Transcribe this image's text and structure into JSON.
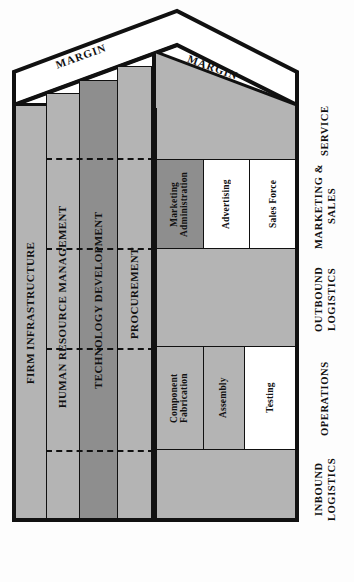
{
  "diagram": {
    "margin_label_left": "MARGIN",
    "margin_label_right": "MARGIN",
    "colors": {
      "support_light": "#b4b4b4",
      "support_dark": "#8e8e8e",
      "primary_gray": "#b4b4b4",
      "primary_dark": "#8e8e8e",
      "primary_white": "#ffffff",
      "stroke": "#111111",
      "background": "#fdfdfd"
    }
  },
  "support_activities": [
    {
      "label": "FIRM INFRASTRUCTURE",
      "shade": "light"
    },
    {
      "label": "HUMAN RESOURCE MANAGEMENT",
      "shade": "light"
    },
    {
      "label": "TECHNOLOGY DEVELOPMENT",
      "shade": "dark"
    },
    {
      "label": "PROCUREMENT",
      "shade": "light"
    }
  ],
  "primary_activities": [
    {
      "label": "SERVICE",
      "boxes": []
    },
    {
      "label": "MARKETING &\nSALES",
      "boxes": [
        {
          "label": "Marketing\nAdministration",
          "shade": "dark"
        },
        {
          "label": "Advertising",
          "shade": "white"
        },
        {
          "label": "Sales Force",
          "shade": "white"
        }
      ]
    },
    {
      "label": "OUTBOUND\nLOGISTICS",
      "boxes": []
    },
    {
      "label": "OPERATIONS",
      "boxes": [
        {
          "label": "Component\nFabrication",
          "shade": "gray"
        },
        {
          "label": "Assembly",
          "shade": "gray"
        },
        {
          "label": "Testing",
          "shade": "white"
        }
      ]
    },
    {
      "label": "INBOUND\nLOGISTICS",
      "boxes": []
    }
  ]
}
